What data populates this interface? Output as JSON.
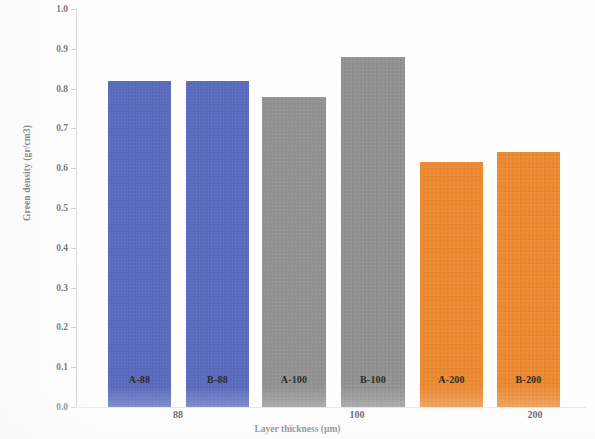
{
  "chart_data": {
    "type": "bar",
    "title": "",
    "xlabel": "Layer thickness (μm)",
    "ylabel": "Green density (gr/cm3)",
    "ylim": [
      0.0,
      1.0
    ],
    "ytick_step": 0.1,
    "grid": false,
    "legend": "none",
    "categories": [
      "A-88",
      "B-88",
      "A-100",
      "B-100",
      "A-200",
      "B-200"
    ],
    "values": [
      0.82,
      0.82,
      0.78,
      0.88,
      0.615,
      0.64
    ],
    "bar_colors": [
      "#5b6cbf",
      "#5b6cbf",
      "#939393",
      "#939393",
      "#ed8b33",
      "#ed8b33"
    ],
    "groups": [
      {
        "label": "88",
        "categories": [
          "A-88",
          "B-88"
        ],
        "color": "#5b6cbf"
      },
      {
        "label": "100",
        "categories": [
          "A-100",
          "B-100"
        ],
        "color": "#939393"
      },
      {
        "label": "200",
        "categories": [
          "A-200",
          "B-200"
        ],
        "color": "#ed8b33"
      }
    ],
    "ytick_labels": [
      "1.0",
      "0.9",
      "0.8",
      "0.7",
      "0.6",
      "0.5",
      "0.4",
      "0.3",
      "0.2",
      "0.1",
      "0.0"
    ],
    "ytick_values": [
      1.0,
      0.9,
      0.8,
      0.7,
      0.6,
      0.5,
      0.4,
      0.3,
      0.2,
      0.1,
      0.0
    ]
  },
  "axis": {
    "y_title": "Green density (gr/cm3)",
    "x_title": "Layer thickness (μm)"
  },
  "bars": [
    {
      "label": "A-88",
      "value": 0.82,
      "color": "#5b6cbf"
    },
    {
      "label": "B-88",
      "value": 0.82,
      "color": "#5b6cbf"
    },
    {
      "label": "A-100",
      "value": 0.78,
      "color": "#939393"
    },
    {
      "label": "B-100",
      "value": 0.88,
      "color": "#939393"
    },
    {
      "label": "A-200",
      "value": 0.615,
      "color": "#ed8b33"
    },
    {
      "label": "B-200",
      "value": 0.64,
      "color": "#ed8b33"
    }
  ],
  "group_labels": [
    "88",
    "100",
    "200"
  ],
  "ticks": [
    "1.0",
    "0.9",
    "0.8",
    "0.7",
    "0.6",
    "0.5",
    "0.4",
    "0.3",
    "0.2",
    "0.1",
    "0.0"
  ],
  "colors": {
    "blue": "#5b6cbf",
    "gray": "#939393",
    "orange": "#ed8b33",
    "axis": "#cfcfcf",
    "text": "#2b2b2b",
    "background": "#fefefe"
  }
}
